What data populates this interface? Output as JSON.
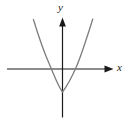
{
  "figure": {
    "type": "math-graph",
    "background_color": "#ffffff",
    "width": 128,
    "height": 124
  },
  "axes": {
    "x": {
      "label": "x",
      "color": "#1a1a1a",
      "origin_px": {
        "x": 62.5,
        "y": 69
      },
      "start_px": {
        "x": 7,
        "y": 69
      },
      "end_px": {
        "x": 113,
        "y": 69
      },
      "arrow": "right",
      "stroke_width": 1.2
    },
    "y": {
      "label": "y",
      "color": "#1a1a1a",
      "origin_px": {
        "x": 62.5,
        "y": 69
      },
      "start_px": {
        "x": 62.5,
        "y": 117
      },
      "end_px": {
        "x": 62.5,
        "y": 18
      },
      "arrow": "up",
      "stroke_width": 1.2
    }
  },
  "chart_data": {
    "type": "line",
    "title": "",
    "xlabel": "x",
    "ylabel": "y",
    "grid": false,
    "legend": null,
    "curve_name": "upward-opening parabola",
    "curve_color": "#7d7d7d",
    "curve_stroke_width": 1.3,
    "vertex": {
      "x": 0,
      "y": -1.6
    },
    "x_intercepts": [
      -1.27,
      1.1
    ],
    "y_intercept": -1.6,
    "xlim": [
      -4.2,
      4.2
    ],
    "ylim": [
      -2.8,
      6.0
    ],
    "x": [
      -2.1,
      -1.8,
      -1.5,
      -1.27,
      -1.0,
      -0.75,
      -0.5,
      -0.25,
      0,
      0.25,
      0.5,
      0.75,
      1.0,
      1.1,
      1.4,
      1.7,
      2.0,
      2.2
    ],
    "values": [
      4.8,
      3.2,
      1.9,
      1.0,
      0.0,
      -0.7,
      -1.2,
      -1.5,
      -1.6,
      -1.5,
      -1.2,
      -0.7,
      -0.1,
      0.0,
      1.3,
      2.7,
      4.3,
      5.4
    ],
    "path_px": "M 33.4,19.5 C 38.0,34.5 44.0,52.0 49.3,64.0 C 54.5,76.0 58.0,86.0 62.5,92.0 C 67.0,86.0 71.5,78.0 76.5,66.5 C 82.0,53.5 88.0,34.0 92.8,19.0",
    "endpoints_px": [
      {
        "x": 33.4,
        "y": 19.5
      },
      {
        "x": 92.8,
        "y": 19.0
      }
    ]
  }
}
